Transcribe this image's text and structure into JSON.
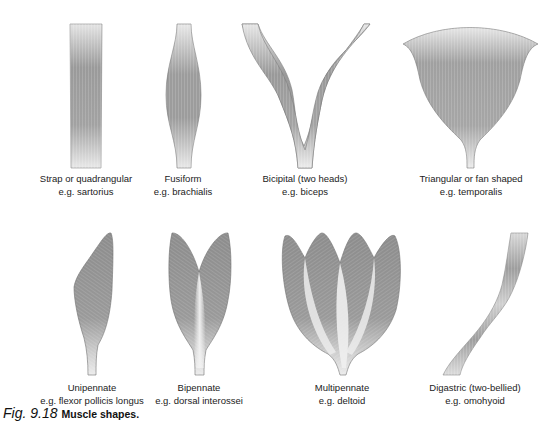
{
  "figure": {
    "number": "Fig. 9.18",
    "title": "Muscle shapes.",
    "colors": {
      "muscle_dark": "#8a8a8a",
      "muscle_mid": "#a8a8a8",
      "muscle_light": "#e6e6e6",
      "outline": "#6e6e6e",
      "text": "#222222"
    },
    "panels": [
      {
        "shape": "strap",
        "name": "Strap or quadrangular",
        "example": "e.g. sartorius"
      },
      {
        "shape": "fusiform",
        "name": "Fusiform",
        "example": "e.g. brachialis"
      },
      {
        "shape": "bicipital",
        "name": "Bicipital (two heads)",
        "example": "e.g. biceps"
      },
      {
        "shape": "triangular",
        "name": "Triangular or fan shaped",
        "example": "e.g. temporalis"
      },
      {
        "shape": "unipennate",
        "name": "Unipennate",
        "example": "e.g. flexor pollicis longus"
      },
      {
        "shape": "bipennate",
        "name": "Bipennate",
        "example": "e.g. dorsal interossei"
      },
      {
        "shape": "multipennate",
        "name": "Multipennate",
        "example": "e.g. deltoid"
      },
      {
        "shape": "digastric",
        "name": "Digastric (two-bellied)",
        "example": "e.g. omohyoid"
      }
    ]
  }
}
